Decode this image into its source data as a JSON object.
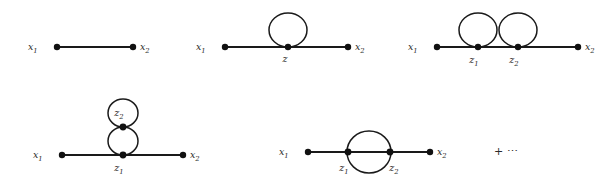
{
  "figure": {
    "kind": "feynman-diagram-expansion",
    "background_color": "#ffffff",
    "ink_color": "#1a1a1a",
    "label_color": "#2b2b2b",
    "continuation": "+ ⋯",
    "diagrams": [
      {
        "id": "tree-propagator",
        "description": "straight line between two external points",
        "labels": {
          "left_external": "x",
          "left_external_sub": "1",
          "right_external": "x",
          "right_external_sub": "2"
        }
      },
      {
        "id": "one-loop-tadpole",
        "description": "single self-loop at one internal vertex",
        "labels": {
          "left_external": "x",
          "left_external_sub": "1",
          "right_external": "x",
          "right_external_sub": "2",
          "vertex": "z",
          "vertex_sub": ""
        }
      },
      {
        "id": "two-loop-double-tadpole",
        "description": "two side-by-side self-loops at two internal vertices",
        "labels": {
          "left_external": "x",
          "left_external_sub": "1",
          "right_external": "x",
          "right_external_sub": "2",
          "vertex_1": "z",
          "vertex_1_sub": "1",
          "vertex_2": "z",
          "vertex_2_sub": "2"
        }
      },
      {
        "id": "stacked-tadpole",
        "description": "self-loop stacked atop another self-loop at one vertex",
        "labels": {
          "left_external": "x",
          "left_external_sub": "1",
          "right_external": "x",
          "right_external_sub": "2",
          "vertex_1": "z",
          "vertex_1_sub": "1",
          "vertex_2": "z",
          "vertex_2_sub": "2"
        }
      },
      {
        "id": "sunset-bubble",
        "description": "two internal vertices joined by an upper arc, a lower arc and a direct line",
        "labels": {
          "left_external": "x",
          "left_external_sub": "1",
          "right_external": "x",
          "right_external_sub": "2",
          "vertex_1": "z",
          "vertex_1_sub": "1",
          "vertex_2": "z",
          "vertex_2_sub": "2"
        }
      }
    ]
  }
}
